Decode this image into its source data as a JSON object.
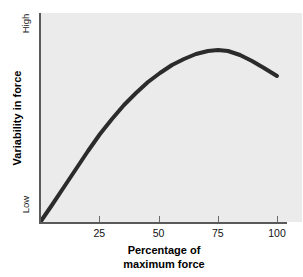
{
  "chart_data": {
    "type": "line",
    "title": "",
    "xlabel": "Percentage of maximum force",
    "xlabel_line1": "Percentage of",
    "xlabel_line2": "maximum force",
    "ylabel": "Variability in force",
    "xlim": [
      0,
      105
    ],
    "ylim": [
      0,
      100
    ],
    "grid": false,
    "legend": null,
    "x_ticks": [
      {
        "value": 25,
        "label": "25"
      },
      {
        "value": 50,
        "label": "50"
      },
      {
        "value": 75,
        "label": "75"
      },
      {
        "value": 100,
        "label": "100"
      }
    ],
    "y_ticks": [
      {
        "value": 95,
        "label": "High"
      },
      {
        "value": 3,
        "label": "Low"
      }
    ],
    "series": [
      {
        "name": "Variability in force vs percentage of maximum force",
        "color": "#2b2b2b",
        "line_width": 4,
        "x": [
          1,
          5,
          10,
          15,
          20,
          25,
          30,
          35,
          40,
          45,
          50,
          55,
          60,
          65,
          70,
          75,
          80,
          85,
          90,
          95,
          100
        ],
        "y": [
          1,
          9,
          19,
          28,
          37,
          45,
          52,
          59,
          65,
          71,
          76,
          81,
          85,
          88,
          90,
          92,
          92.5,
          91.5,
          89,
          85,
          79
        ]
      }
    ],
    "curve_points_px": [
      [
        41,
        221
      ],
      [
        52,
        205
      ],
      [
        64,
        187
      ],
      [
        76,
        169
      ],
      [
        88,
        151
      ],
      [
        100,
        134
      ],
      [
        112,
        119
      ],
      [
        124,
        105
      ],
      [
        136,
        93
      ],
      [
        148,
        82
      ],
      [
        160,
        73
      ],
      [
        172,
        65
      ],
      [
        184,
        59
      ],
      [
        196,
        54
      ],
      [
        208,
        51
      ],
      [
        218,
        50
      ],
      [
        228,
        51
      ],
      [
        240,
        55
      ],
      [
        252,
        61
      ],
      [
        264,
        68
      ],
      [
        277,
        76
      ]
    ],
    "colors": {
      "plot_background": "#ebebeb",
      "figure_background": "#ffffff",
      "axis": "#5a5a5a",
      "curve": "#2b2b2b",
      "text": "#111111"
    }
  }
}
